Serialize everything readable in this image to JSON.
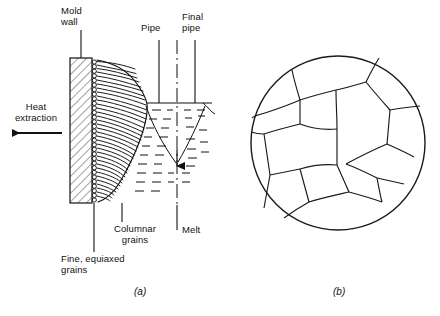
{
  "figure": {
    "title_hidden": "",
    "panels": [
      {
        "id": "a",
        "caption": "(a)"
      },
      {
        "id": "b",
        "caption": "(b)"
      }
    ]
  },
  "labels": {
    "mold_wall": "Mold\nwall",
    "pipe": "Pipe",
    "final_pipe": "Final\npipe",
    "heat_extraction": "Heat\nextraction",
    "columnar_grains": "Columnar\ngrains",
    "fine_equiaxed_grains": "Fine, equiaxed\ngrains",
    "melt": "Melt",
    "caption_a": "(a)",
    "caption_b": "(b)"
  },
  "icons": {
    "heat_arrow": "left-arrow-icon",
    "pipe_arrow": "down-arrow-icon"
  },
  "colors": {
    "stroke": "#1a1a1a",
    "background": "#ffffff",
    "hatch": "#444444"
  },
  "geometry": {
    "mold_wall_rect": {
      "x": 70,
      "y": 58,
      "w": 22,
      "h": 145
    },
    "melt_surface_y": 103,
    "circle_b": {
      "cx": 338,
      "cy": 143,
      "r": 87
    }
  }
}
